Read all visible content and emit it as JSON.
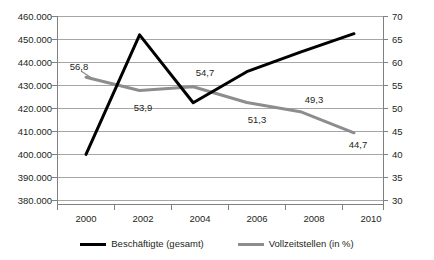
{
  "chart_data": {
    "type": "line",
    "title": "",
    "subtitle": "",
    "xlabel": "",
    "ylabel": "",
    "grid": true,
    "legend_position": "bottom",
    "categories": [
      "2000",
      "2002",
      "2004",
      "2006",
      "2008",
      "2010"
    ],
    "x_tick_labels": [
      "2000",
      "2002",
      "2004",
      "2006",
      "2008",
      "2010"
    ],
    "axes": [
      {
        "id": "left",
        "label": "",
        "ylim": [
          380000,
          460000
        ],
        "tick_step": 10000,
        "tick_labels": [
          "380.000",
          "390.000",
          "400.000",
          "410.000",
          "420.000",
          "430.000",
          "440.000",
          "450.000",
          "460.000"
        ],
        "tick_values": [
          380000,
          390000,
          400000,
          410000,
          420000,
          430000,
          440000,
          450000,
          460000
        ]
      },
      {
        "id": "right",
        "label": "",
        "ylim": [
          30,
          70
        ],
        "tick_step": 5,
        "tick_labels": [
          "30",
          "35",
          "40",
          "45",
          "50",
          "55",
          "60",
          "65",
          "70"
        ],
        "tick_values": [
          30,
          35,
          40,
          45,
          50,
          55,
          60,
          65,
          70
        ]
      }
    ],
    "series": [
      {
        "name": "Beschäftigte (gesamt)",
        "axis": "left",
        "color": "#000000",
        "values": [
          400000,
          452000,
          422500,
          436000,
          444500,
          452500
        ],
        "data_labels": []
      },
      {
        "name": "Vollzeitstellen (in %)",
        "axis": "right",
        "color": "#8d8d8d",
        "values": [
          56.8,
          53.9,
          54.7,
          51.3,
          49.3,
          44.7
        ],
        "data_labels": [
          "56,8",
          "53,9",
          "54,7",
          "51,3",
          "49,3",
          "44,7"
        ]
      }
    ]
  },
  "legend": {
    "entries": [
      {
        "label": "Beschäftigte (gesamt)",
        "color": "#000000"
      },
      {
        "label": "Vollzeitstellen (in %)",
        "color": "#8d8d8d"
      }
    ]
  },
  "y_left_labels": {
    "l0": "460.000",
    "l1": "450.000",
    "l2": "440.000",
    "l3": "430.000",
    "l4": "420.000",
    "l5": "410.000",
    "l6": "400.000",
    "l7": "390.000",
    "l8": "380.000"
  },
  "y_right_labels": {
    "r0": "70",
    "r1": "65",
    "r2": "60",
    "r3": "55",
    "r4": "50",
    "r5": "45",
    "r6": "40",
    "r7": "35",
    "r8": "30"
  },
  "x_labels": {
    "x0": "2000",
    "x1": "2002",
    "x2": "2004",
    "x3": "2006",
    "x4": "2008",
    "x5": "2010"
  },
  "point_labels": {
    "p0": "56,8",
    "p1": "53,9",
    "p2": "54,7",
    "p3": "51,3",
    "p4": "49,3",
    "p5": "44,7"
  }
}
